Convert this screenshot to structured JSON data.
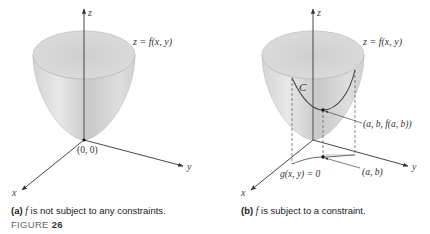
{
  "figure": {
    "label_prefix": "FIGURE",
    "label_number": "26"
  },
  "panel_a": {
    "tag": "(a)",
    "caption_var": "f",
    "caption_text": " is not subject to any constraints.",
    "surface_label": "z = f(x, y)",
    "origin_label": "(0, 0)",
    "axes": {
      "x": "x",
      "y": "y",
      "z": "z"
    }
  },
  "panel_b": {
    "tag": "(b)",
    "caption_var": "f",
    "caption_text": " is subject to a constraint.",
    "surface_label": "z = f(x, y)",
    "curve_label": "C",
    "point_3d_label": "(a, b, f(a, b))",
    "point_2d_label": "(a, b)",
    "constraint_label": "g(x, y) = 0",
    "axes": {
      "x": "x",
      "y": "y",
      "z": "z"
    }
  },
  "colors": {
    "surface_light": "#e6e6e6",
    "surface_dark": "#b8b8b8",
    "axis": "#333333",
    "curve": "#444444"
  }
}
